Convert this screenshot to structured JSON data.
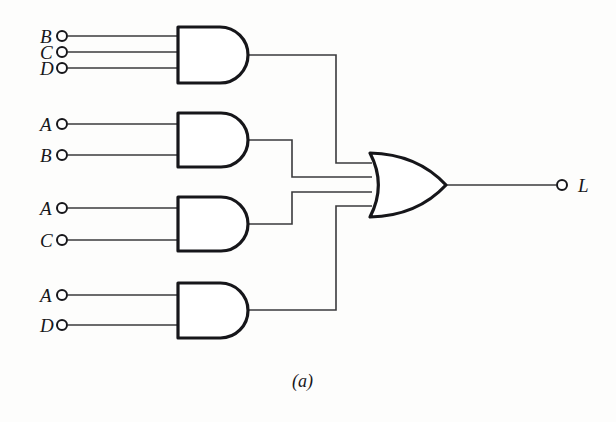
{
  "figure": {
    "caption": "(a)",
    "caption_x": 292,
    "caption_y": 371,
    "background_color": "#fdfdfc",
    "ink_color": "#16161a",
    "wire_color": "#3a3a3c"
  },
  "output": {
    "label": "L",
    "label_x": 578,
    "label_y": 176,
    "terminal_x": 562,
    "terminal_y": 185,
    "wire_from_x": 446,
    "wire_to_x": 556
  },
  "or_gate": {
    "name": "or-gate-output",
    "label": "OR",
    "x": 370,
    "y": 153,
    "width": 76,
    "height": 64,
    "input_count": 4,
    "input_ys": [
      163,
      177,
      192,
      206
    ],
    "output_y": 185
  },
  "and_gates": [
    {
      "name": "and-gate-1",
      "label": "AND",
      "x": 178,
      "y": 27,
      "width": 70,
      "height": 56,
      "output_y": 55,
      "route_x": 336,
      "or_input_index": 0,
      "inputs": [
        {
          "label": "B",
          "terminal_x": 62,
          "terminal_y": 36,
          "label_x": 40,
          "label_y": 27
        },
        {
          "label": "C",
          "terminal_x": 62,
          "terminal_y": 52,
          "label_x": 40,
          "label_y": 43
        },
        {
          "label": "D",
          "terminal_x": 62,
          "terminal_y": 68,
          "label_x": 40,
          "label_y": 59
        }
      ]
    },
    {
      "name": "and-gate-2",
      "label": "AND",
      "x": 178,
      "y": 113,
      "width": 70,
      "height": 54,
      "output_y": 140,
      "route_x": 292,
      "or_input_index": 1,
      "inputs": [
        {
          "label": "A",
          "terminal_x": 62,
          "terminal_y": 124,
          "label_x": 40,
          "label_y": 115
        },
        {
          "label": "B",
          "terminal_x": 62,
          "terminal_y": 155,
          "label_x": 40,
          "label_y": 146
        }
      ]
    },
    {
      "name": "and-gate-3",
      "label": "AND",
      "x": 178,
      "y": 197,
      "width": 70,
      "height": 54,
      "output_y": 224,
      "route_x": 292,
      "or_input_index": 2,
      "inputs": [
        {
          "label": "A",
          "terminal_x": 62,
          "terminal_y": 208,
          "label_x": 40,
          "label_y": 199
        },
        {
          "label": "C",
          "terminal_x": 62,
          "terminal_y": 240,
          "label_x": 40,
          "label_y": 231
        }
      ]
    },
    {
      "name": "and-gate-4",
      "label": "AND",
      "x": 178,
      "y": 283,
      "width": 70,
      "height": 55,
      "output_y": 310,
      "route_x": 336,
      "or_input_index": 3,
      "inputs": [
        {
          "label": "A",
          "terminal_x": 62,
          "terminal_y": 295,
          "label_x": 40,
          "label_y": 286
        },
        {
          "label": "D",
          "terminal_x": 62,
          "terminal_y": 325,
          "label_x": 40,
          "label_y": 316
        }
      ]
    }
  ]
}
